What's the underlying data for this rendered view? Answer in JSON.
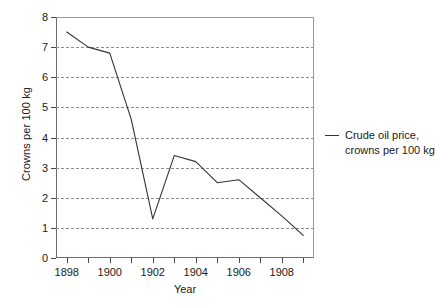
{
  "chart_data": {
    "type": "line",
    "title": "",
    "xlabel": "Year",
    "ylabel": "Crowns per 100 kg",
    "xlim": [
      1897.5,
      1909.5
    ],
    "ylim": [
      0,
      8
    ],
    "grid": true,
    "legend_position": "right",
    "x": [
      1898,
      1899,
      1900,
      1901,
      1902,
      1903,
      1904,
      1905,
      1906,
      1907,
      1908,
      1909
    ],
    "series": [
      {
        "name": "Crude oil price, crowns per 100 kg",
        "color": "#333333",
        "values": [
          7.5,
          7.0,
          6.8,
          4.6,
          1.3,
          3.4,
          3.2,
          2.5,
          2.6,
          2.0,
          1.4,
          0.75
        ]
      }
    ],
    "y_ticks": [
      0,
      1,
      2,
      3,
      4,
      5,
      6,
      7,
      8
    ],
    "y_tick_labels": [
      "0",
      "1",
      "2",
      "3",
      "4",
      "5",
      "6",
      "7",
      "8"
    ],
    "x_ticks": [
      1898,
      1899,
      1900,
      1901,
      1902,
      1903,
      1904,
      1905,
      1906,
      1907,
      1908,
      1909
    ],
    "x_tick_labels": [
      "1898",
      "",
      "1900",
      "",
      "1902",
      "",
      "1904",
      "",
      "1906",
      "",
      "1908",
      ""
    ]
  },
  "legend": {
    "line1": "Crude oil price,",
    "line2": "crowns per 100 kg"
  }
}
